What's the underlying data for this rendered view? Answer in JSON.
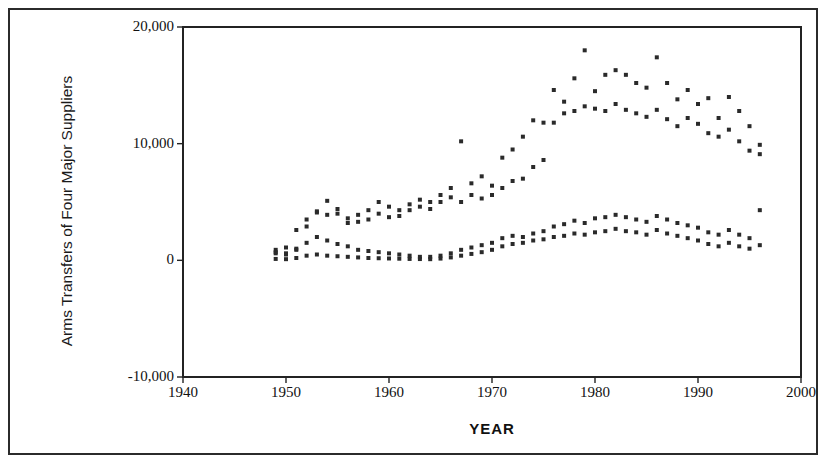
{
  "figure": {
    "background_color": "#ffffff",
    "frame_color": "#2b2b2b"
  },
  "chart_data": {
    "type": "scatter",
    "title": "",
    "xlabel": "YEAR",
    "ylabel": "Arms Transfers of Four Major Suppliers",
    "xlim": [
      1940,
      2000
    ],
    "ylim": [
      -10000,
      20000
    ],
    "xticks": [
      1940,
      1950,
      1960,
      1970,
      1980,
      1990,
      2000
    ],
    "xtick_labels": [
      "1940",
      "1950",
      "1960",
      "1970",
      "1980",
      "1990",
      "2000"
    ],
    "yticks": [
      -10000,
      0,
      10000,
      20000
    ],
    "ytick_labels": [
      "-10,000",
      "0",
      "10,000",
      "20,000"
    ],
    "grid": false,
    "legend": null,
    "marker": "square",
    "marker_color": "#2a2a2a",
    "marker_size": 4,
    "series": [
      {
        "name": "Supplier 1",
        "x": [
          1949,
          1950,
          1951,
          1952,
          1953,
          1954,
          1955,
          1956,
          1957,
          1958,
          1959,
          1960,
          1961,
          1962,
          1963,
          1964,
          1965,
          1966,
          1967,
          1968,
          1969,
          1970,
          1971,
          1972,
          1973,
          1974,
          1975,
          1976,
          1977,
          1978,
          1979,
          1980,
          1981,
          1982,
          1983,
          1984,
          1985,
          1986,
          1987,
          1988,
          1989,
          1990,
          1991,
          1992,
          1993,
          1994,
          1995,
          1996
        ],
        "y": [
          900,
          1100,
          1000,
          2900,
          4200,
          5100,
          4400,
          3600,
          3900,
          4300,
          5000,
          4600,
          4300,
          4800,
          5200,
          5000,
          5600,
          6200,
          10200,
          6600,
          7200,
          6400,
          8800,
          9500,
          10600,
          12000,
          11800,
          14600,
          13600,
          15600,
          18000,
          14500,
          15900,
          16300,
          15900,
          15200,
          14800,
          17400,
          15200,
          13800,
          14600,
          13400,
          13900,
          12200,
          14000,
          12800,
          11500,
          9900
        ]
      },
      {
        "name": "Supplier 2",
        "x": [
          1949,
          1950,
          1951,
          1952,
          1953,
          1954,
          1955,
          1956,
          1957,
          1958,
          1959,
          1960,
          1961,
          1962,
          1963,
          1964,
          1965,
          1966,
          1967,
          1968,
          1969,
          1970,
          1971,
          1972,
          1973,
          1974,
          1975,
          1976,
          1977,
          1978,
          1979,
          1980,
          1981,
          1982,
          1983,
          1984,
          1985,
          1986,
          1987,
          1988,
          1989,
          1990,
          1991,
          1992,
          1993,
          1994,
          1995,
          1996
        ],
        "y": [
          700,
          600,
          2600,
          3500,
          4100,
          3900,
          4000,
          3200,
          3300,
          3500,
          4000,
          3700,
          3800,
          4300,
          4600,
          4400,
          5000,
          5400,
          5000,
          5600,
          5300,
          5600,
          6200,
          6800,
          7000,
          8000,
          8600,
          11800,
          12600,
          12800,
          13200,
          13000,
          12800,
          13400,
          12900,
          12600,
          12300,
          12900,
          12100,
          11500,
          12200,
          11700,
          10900,
          10600,
          11200,
          10200,
          9400,
          9100
        ]
      },
      {
        "name": "Supplier 3",
        "x": [
          1949,
          1950,
          1951,
          1952,
          1953,
          1954,
          1955,
          1956,
          1957,
          1958,
          1959,
          1960,
          1961,
          1962,
          1963,
          1964,
          1965,
          1966,
          1967,
          1968,
          1969,
          1970,
          1971,
          1972,
          1973,
          1974,
          1975,
          1976,
          1977,
          1978,
          1979,
          1980,
          1981,
          1982,
          1983,
          1984,
          1985,
          1986,
          1987,
          1988,
          1989,
          1990,
          1991,
          1992,
          1993,
          1994,
          1995,
          1996
        ],
        "y": [
          600,
          500,
          900,
          1500,
          2000,
          1700,
          1400,
          1200,
          900,
          800,
          700,
          600,
          500,
          400,
          300,
          300,
          400,
          600,
          900,
          1100,
          1300,
          1500,
          1900,
          2100,
          2000,
          2300,
          2500,
          2900,
          3100,
          3400,
          3200,
          3600,
          3700,
          3900,
          3700,
          3500,
          3300,
          3800,
          3500,
          3200,
          3000,
          2800,
          2400,
          2200,
          2600,
          2200,
          1900,
          4300
        ]
      },
      {
        "name": "Supplier 4",
        "x": [
          1949,
          1950,
          1951,
          1952,
          1953,
          1954,
          1955,
          1956,
          1957,
          1958,
          1959,
          1960,
          1961,
          1962,
          1963,
          1964,
          1965,
          1966,
          1967,
          1968,
          1969,
          1970,
          1971,
          1972,
          1973,
          1974,
          1975,
          1976,
          1977,
          1978,
          1979,
          1980,
          1981,
          1982,
          1983,
          1984,
          1985,
          1986,
          1987,
          1988,
          1989,
          1990,
          1991,
          1992,
          1993,
          1994,
          1995,
          1996
        ],
        "y": [
          120,
          100,
          200,
          400,
          500,
          400,
          350,
          300,
          250,
          200,
          180,
          160,
          140,
          120,
          110,
          100,
          150,
          250,
          400,
          550,
          700,
          900,
          1200,
          1400,
          1500,
          1700,
          1800,
          2000,
          2100,
          2300,
          2200,
          2400,
          2500,
          2700,
          2500,
          2400,
          2200,
          2600,
          2300,
          2100,
          1900,
          1700,
          1400,
          1200,
          1500,
          1200,
          1000,
          1300
        ]
      }
    ]
  }
}
